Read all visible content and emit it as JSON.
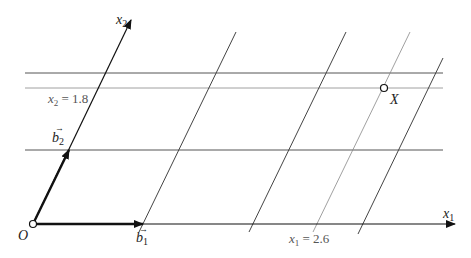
{
  "diagram": {
    "labels": {
      "origin": "O",
      "axis_x1": "x",
      "axis_x1_sub": "1",
      "axis_x2": "x",
      "axis_x2_sub": "2",
      "vector_b1": "b",
      "vector_b1_sub": "1",
      "vector_b2": "b",
      "vector_b2_sub": "2",
      "vector_arrow": "→",
      "point": "X",
      "x2_line_label": "x",
      "x2_line_sub": "2",
      "x2_line_value": " = 1.8",
      "x1_line_label": "x",
      "x1_line_sub": "1",
      "x1_line_value": " = 2.6"
    },
    "colors": {
      "axis": "#111111",
      "grid": "#444444",
      "highlight_line": "#888888"
    },
    "point_X": {
      "x1": 2.6,
      "x2": 1.8
    }
  }
}
